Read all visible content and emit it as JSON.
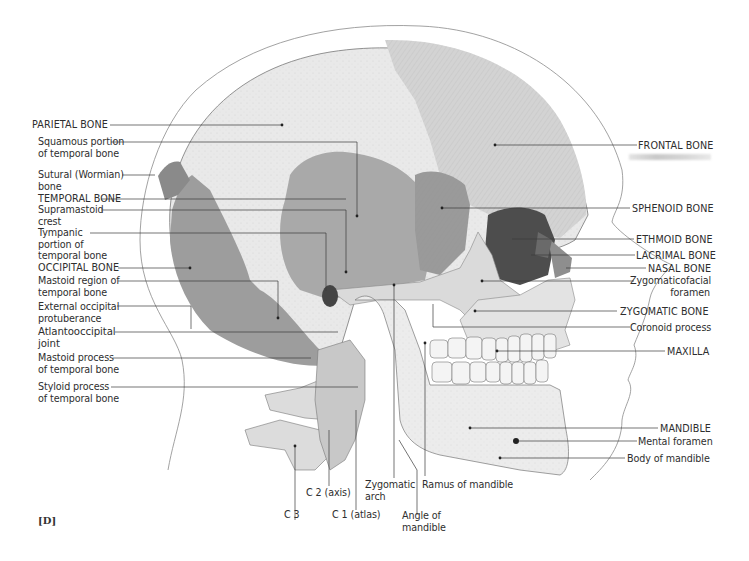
{
  "figure": {
    "panel_label": "[D]"
  },
  "labels_left": [
    {
      "id": "parietal",
      "text": "PARIETAL BONE",
      "x": 32,
      "y": 120
    },
    {
      "id": "squamous",
      "text": "Squamous portion\nof temporal bone",
      "x": 38,
      "y": 163
    },
    {
      "id": "sutural",
      "text": "Sutural (Wormian)\nbone",
      "x": 38,
      "y": 171
    },
    {
      "id": "temporal",
      "text": "TEMPORAL BONE",
      "x": 38,
      "y": 194
    },
    {
      "id": "supramastoid",
      "text": "Supramastoid\ncrest",
      "x": 38,
      "y": 205
    },
    {
      "id": "tympanic",
      "text": "Tympanic\nportion of\ntemporal bone",
      "x": 38,
      "y": 228
    },
    {
      "id": "occipital",
      "text": "OCCIPITAL BONE",
      "x": 38,
      "y": 264
    },
    {
      "id": "mastoid_region",
      "text": "Mastoid region of\ntemporal bone",
      "x": 38,
      "y": 276
    },
    {
      "id": "ext_occipital",
      "text": "External occipital\nprotuberance",
      "x": 38,
      "y": 302
    },
    {
      "id": "atlantooccipital",
      "text": "Atlantooccipital\njoint",
      "x": 38,
      "y": 327
    },
    {
      "id": "mastoid_process",
      "text": "Mastoid process\nof temporal bone",
      "x": 38,
      "y": 355
    },
    {
      "id": "styloid",
      "text": "Styloid process\nof temporal bone",
      "x": 38,
      "y": 382
    }
  ],
  "labels_right": [
    {
      "id": "frontal",
      "text": "FRONTAL BONE"
    },
    {
      "id": "sphenoid",
      "text": "SPHENOID BONE"
    },
    {
      "id": "ethmoid",
      "text": "ETHMOID BONE"
    },
    {
      "id": "lacrimal",
      "text": "LACRIMAL BONE"
    },
    {
      "id": "nasal",
      "text": "NASAL BONE"
    },
    {
      "id": "zygomaticofacial",
      "text": "Zygomaticofacial\nforamen"
    },
    {
      "id": "zygomatic",
      "text": "ZYGOMATIC BONE"
    },
    {
      "id": "coronoid",
      "text": "Coronoid process"
    },
    {
      "id": "maxilla",
      "text": "MAXILLA"
    },
    {
      "id": "mandible",
      "text": "MANDIBLE"
    },
    {
      "id": "mental_foramen",
      "text": "Mental foramen"
    },
    {
      "id": "body_mandible",
      "text": "Body of mandible"
    }
  ],
  "labels_bottom": [
    {
      "id": "c3",
      "text": "C 3"
    },
    {
      "id": "c2",
      "text": "C 2 (axis)"
    },
    {
      "id": "c1",
      "text": "C 1 (atlas)"
    },
    {
      "id": "zyg_arch",
      "text": "Zygomatic\narch"
    },
    {
      "id": "angle",
      "text": "Angle of\nmandible"
    },
    {
      "id": "ramus",
      "text": "Ramus of mandible"
    }
  ],
  "colors": {
    "background": "#ffffff",
    "bone_light": "#e6e6e6",
    "bone_mid": "#cfcfcf",
    "temporal_fill": "#a9a9a9",
    "occipital_fill": "#9c9c9c",
    "sphenoid_fill": "#8f8f8f",
    "orbit_dark": "#4a4a4a",
    "leader_line": "#3a3a3a",
    "label_text": "#2e2e2e"
  }
}
